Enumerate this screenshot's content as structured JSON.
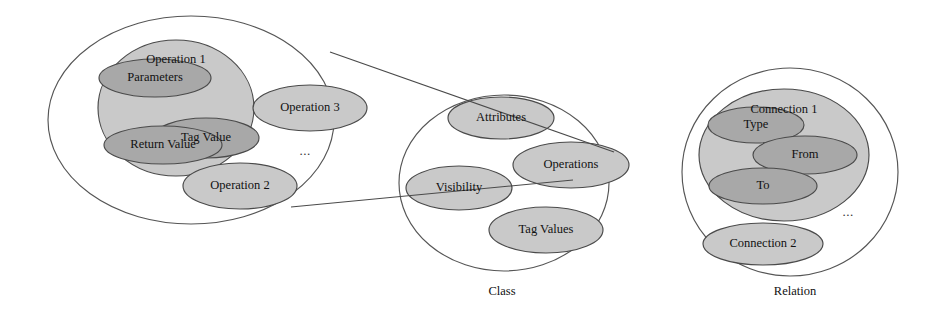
{
  "diagram": {
    "canvas": {
      "width": 935,
      "height": 323
    },
    "colors": {
      "background": "#ffffff",
      "outline_fill": "#ffffff",
      "mid_fill": "#c9c9c9",
      "inner_fill": "#a8a8a8",
      "stroke": "#4a4a4a",
      "text": "#111111"
    },
    "clusters": [
      {
        "id": "operation-cluster",
        "caption": "",
        "outer": {
          "cx": 191,
          "cy": 120,
          "rx": 143,
          "ry": 104
        },
        "nodes": [
          {
            "id": "operation-1",
            "label": "Operation 1",
            "level": "mid",
            "cx": 176,
            "cy": 108,
            "rx": 78,
            "ry": 68,
            "label_dx": 0,
            "label_dy": -48
          },
          {
            "id": "parameters",
            "label": "Parameters",
            "level": "inner",
            "cx": 155,
            "cy": 78,
            "rx": 56,
            "ry": 19,
            "label_dx": 0,
            "label_dy": 0
          },
          {
            "id": "tag-value",
            "label": "Tag Value",
            "level": "inner",
            "cx": 206,
            "cy": 138,
            "rx": 53,
            "ry": 20,
            "label_dx": 0,
            "label_dy": 0
          },
          {
            "id": "return-value",
            "label": "Return Value",
            "level": "inner",
            "cx": 163,
            "cy": 145,
            "rx": 59,
            "ry": 19,
            "label_dx": 0,
            "label_dy": 0
          },
          {
            "id": "operation-3",
            "label": "Operation 3",
            "level": "mid",
            "cx": 310,
            "cy": 108,
            "rx": 57,
            "ry": 23,
            "label_dx": 0,
            "label_dy": 0
          },
          {
            "id": "operation-2",
            "label": "Operation 2",
            "level": "mid",
            "cx": 240,
            "cy": 186,
            "rx": 57,
            "ry": 23,
            "label_dx": 0,
            "label_dy": 0
          }
        ],
        "ellipsis": {
          "x": 305,
          "y": 152,
          "text": "..."
        }
      },
      {
        "id": "class-cluster",
        "caption": "Class",
        "caption_x": 502,
        "caption_y": 292,
        "outer": {
          "cx": 504,
          "cy": 183,
          "rx": 105,
          "ry": 88
        },
        "nodes": [
          {
            "id": "attributes",
            "label": "Attributes",
            "level": "mid",
            "cx": 501,
            "cy": 118,
            "rx": 53,
            "ry": 21,
            "label_dx": 0,
            "label_dy": 0
          },
          {
            "id": "operations",
            "label": "Operations",
            "level": "mid",
            "cx": 571,
            "cy": 165,
            "rx": 58,
            "ry": 23,
            "label_dx": 0,
            "label_dy": 0
          },
          {
            "id": "visibility",
            "label": "Visibility",
            "level": "mid",
            "cx": 459,
            "cy": 188,
            "rx": 53,
            "ry": 22,
            "label_dx": 0,
            "label_dy": 0
          },
          {
            "id": "tag-values",
            "label": "Tag Values",
            "level": "mid",
            "cx": 546,
            "cy": 230,
            "rx": 57,
            "ry": 23,
            "label_dx": 0,
            "label_dy": 0
          }
        ],
        "ellipsis": null
      },
      {
        "id": "relation-cluster",
        "caption": "Relation",
        "caption_x": 795,
        "caption_y": 292,
        "outer": {
          "cx": 790,
          "cy": 172,
          "rx": 108,
          "ry": 104
        },
        "nodes": [
          {
            "id": "connection-1",
            "label": "Connection 1",
            "level": "mid",
            "cx": 784,
            "cy": 155,
            "rx": 85,
            "ry": 66,
            "label_dx": 0,
            "label_dy": -45
          },
          {
            "id": "type",
            "label": "Type",
            "level": "inner",
            "cx": 756,
            "cy": 125,
            "rx": 48,
            "ry": 18,
            "label_dx": 0,
            "label_dy": 0
          },
          {
            "id": "from",
            "label": "From",
            "level": "inner",
            "cx": 805,
            "cy": 155,
            "rx": 52,
            "ry": 19,
            "label_dx": 0,
            "label_dy": 0
          },
          {
            "id": "to",
            "label": "To",
            "level": "inner",
            "cx": 763,
            "cy": 186,
            "rx": 54,
            "ry": 18,
            "label_dx": 0,
            "label_dy": 0
          },
          {
            "id": "connection-2",
            "label": "Connection 2",
            "level": "mid",
            "cx": 763,
            "cy": 244,
            "rx": 60,
            "ry": 21,
            "label_dx": 0,
            "label_dy": 0
          }
        ],
        "ellipsis": {
          "x": 848,
          "y": 213,
          "text": "..."
        }
      }
    ],
    "links": [
      {
        "id": "link-operations-top",
        "from": "operation-cluster",
        "to": "operations",
        "x1": 330,
        "y1": 52,
        "x2": 614,
        "y2": 152
      },
      {
        "id": "link-operations-bottom",
        "from": "operation-cluster",
        "to": "operations",
        "x1": 291,
        "y1": 207,
        "x2": 573,
        "y2": 180
      }
    ]
  }
}
